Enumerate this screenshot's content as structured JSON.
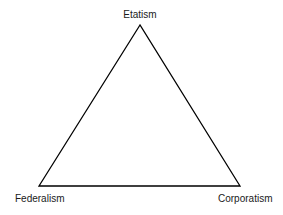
{
  "diagram": {
    "type": "triangle",
    "stroke_color": "#000000",
    "vertices": {
      "top": {
        "label": "Etatism",
        "x": 140,
        "y": 25
      },
      "bottom_left": {
        "label": "Federalism",
        "x": 39,
        "y": 186
      },
      "bottom_right": {
        "label": "Corporatism",
        "x": 240,
        "y": 186
      }
    }
  }
}
